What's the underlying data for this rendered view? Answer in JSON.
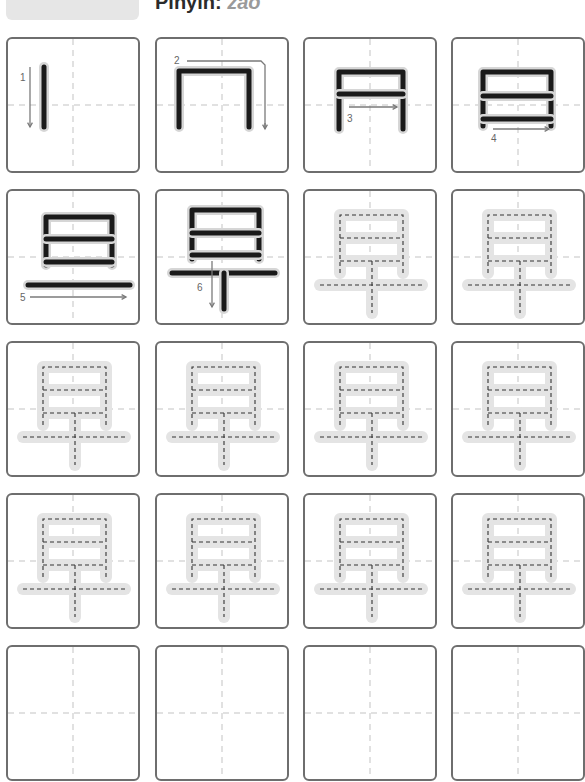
{
  "header": {
    "pinyin_label": "Pinyin:",
    "pinyin_value": "zǎo",
    "character": "早"
  },
  "grid": {
    "rows": 5,
    "columns": 4,
    "guide_color": "#d8d8d8",
    "border_color": "#6e6e6e",
    "stroke_color": "#1a1a1a",
    "trace_fill": "#e4e4e4",
    "arrow_color": "#7a7a7a"
  },
  "stroke_order": [
    {
      "step": 1,
      "number_label": "1"
    },
    {
      "step": 2,
      "number_label": "2"
    },
    {
      "step": 3,
      "number_label": "3"
    },
    {
      "step": 4,
      "number_label": "4"
    },
    {
      "step": 5,
      "number_label": "5"
    },
    {
      "step": 6,
      "number_label": "6"
    }
  ],
  "practice": {
    "trace_cells": 10,
    "blank_cells": 4
  }
}
